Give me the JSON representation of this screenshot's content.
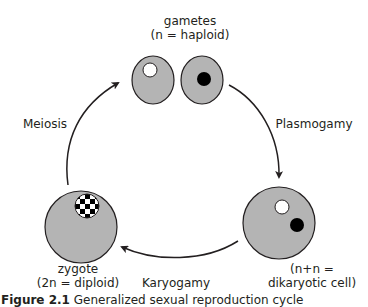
{
  "colors": {
    "cell_fill": "#b4b4b4",
    "outline": "#231f20",
    "nucleus_black": "#000000",
    "nucleus_white": "#ffffff",
    "background": "#ffffff"
  },
  "stages": {
    "gametes": {
      "line1": "gametes",
      "line2": "(n = haploid)"
    },
    "dikaryotic": {
      "line1": "(n+n =",
      "line2": "dikaryotic cell)"
    },
    "zygote": {
      "line1": "zygote",
      "line2": "(2n = diploid)"
    }
  },
  "transitions": {
    "meiosis": "Meiosis",
    "plasmogamy": "Plasmogamy",
    "karyogamy": "Karyogamy"
  },
  "caption": {
    "figure_label": "Figure 2.1",
    "text": "Generalized sexual reproduction cycle"
  }
}
